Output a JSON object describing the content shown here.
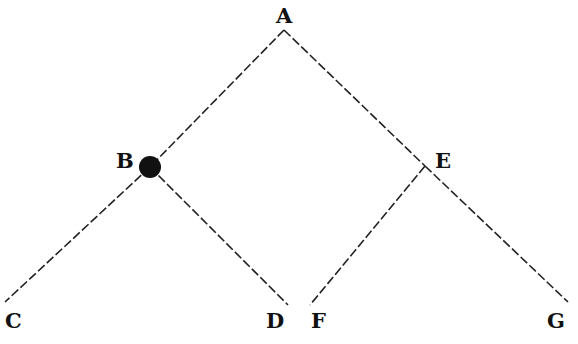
{
  "diagram": {
    "type": "binary-tree",
    "nodes": [
      {
        "id": "A",
        "label": "A",
        "x": 284,
        "y": 30,
        "marked": false
      },
      {
        "id": "B",
        "label": "B",
        "x": 150,
        "y": 167,
        "marked": true
      },
      {
        "id": "E",
        "label": "E",
        "x": 425,
        "y": 166,
        "marked": false
      },
      {
        "id": "C",
        "label": "C",
        "x": 5,
        "y": 302,
        "marked": false
      },
      {
        "id": "D",
        "label": "D",
        "x": 288,
        "y": 305,
        "marked": false
      },
      {
        "id": "F",
        "label": "F",
        "x": 310,
        "y": 305,
        "marked": false
      },
      {
        "id": "G",
        "label": "G",
        "x": 568,
        "y": 302,
        "marked": false
      }
    ],
    "edges": [
      {
        "from": "A",
        "to": "B"
      },
      {
        "from": "A",
        "to": "E"
      },
      {
        "from": "B",
        "to": "C"
      },
      {
        "from": "B",
        "to": "D"
      },
      {
        "from": "E",
        "to": "F"
      },
      {
        "from": "E",
        "to": "G"
      }
    ],
    "line_style": "dashed",
    "colors": {
      "line": "#222222",
      "marker": "#111111",
      "text": "#111111"
    }
  }
}
